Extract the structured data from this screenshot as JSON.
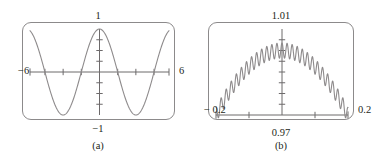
{
  "figure": {
    "background": "#ffffff",
    "ink": "#231f20",
    "frame_color": "#8c8a8b",
    "curve_color": "#8e8b8c",
    "axis_color": "#6d6a6b"
  },
  "panels": [
    {
      "id": "a",
      "caption": "(a)",
      "frame": {
        "x": 22,
        "y": 22,
        "width": 153,
        "height": 98
      },
      "caption_x": 98,
      "caption_y": 140,
      "labels": {
        "top": "1",
        "bottom": "−1",
        "left": "−6",
        "right": "6"
      },
      "label_pos": {
        "top": {
          "x": 98,
          "y": 11
        },
        "bottom": {
          "x": 98,
          "y": 124
        },
        "left": {
          "x": 18,
          "y": 71
        },
        "right": {
          "x": 179,
          "y": 71
        }
      },
      "chart_data": {
        "type": "line",
        "title": "",
        "xlabel": "",
        "ylabel": "",
        "xlim": [
          -6,
          6
        ],
        "ylim": [
          -1,
          1
        ],
        "grid": false,
        "legend": null,
        "x_ticks": [
          -4.71,
          -3.14,
          -1.57,
          1.57,
          3.14,
          4.71
        ],
        "y_ticks": [
          -0.75,
          -0.5,
          -0.25,
          0.25,
          0.5,
          0.75
        ],
        "x_tick_labels": [
          "−6",
          "6"
        ],
        "y_tick_labels": [
          "−1",
          "1"
        ],
        "series": [
          {
            "name": "cos x",
            "function": "cos",
            "amplitude": 1.0,
            "period": 6.2832,
            "samples": 400
          }
        ]
      }
    },
    {
      "id": "b",
      "caption": "(b)",
      "frame": {
        "x": 208,
        "y": 22,
        "width": 146,
        "height": 98
      },
      "caption_x": 281,
      "caption_y": 140,
      "labels": {
        "top": "1.01",
        "bottom": "0.97",
        "left": "− 0.2",
        "right": "0.2"
      },
      "label_pos": {
        "top": {
          "x": 281,
          "y": 11
        },
        "bottom": {
          "x": 281,
          "y": 128
        },
        "left": {
          "x": 204,
          "y": 110
        },
        "right": {
          "x": 358,
          "y": 110
        }
      },
      "chart_data": {
        "type": "line",
        "title": "",
        "xlabel": "",
        "ylabel": "",
        "xlim": [
          -0.2,
          0.2
        ],
        "ylim": [
          0.97,
          1.01
        ],
        "grid": false,
        "legend": null,
        "x_ticks": [
          -0.1,
          0.1
        ],
        "y_ticks": [
          0.975,
          0.98,
          0.985,
          0.99,
          0.995,
          1.0,
          1.005
        ],
        "x_tick_labels": [
          "− 0.2",
          "0.2"
        ],
        "y_tick_labels": [
          "0.97",
          "1.01"
        ],
        "series": [
          {
            "name": "cos x + 0.001 cos(200 x) envelope",
            "envelope_function": "cos",
            "ripple_cycles": 13,
            "ripple_amplitude": 0.0035,
            "samples": 900
          }
        ]
      }
    }
  ]
}
